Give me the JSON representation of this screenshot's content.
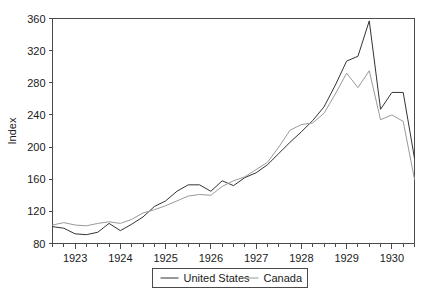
{
  "chart_data": {
    "type": "line",
    "title": "",
    "xlabel": "",
    "ylabel": "Index",
    "ylim": [
      80,
      360
    ],
    "xlim": [
      1922.5,
      1930.5
    ],
    "grid": false,
    "legend_position": "bottom-center",
    "y_ticks": [
      80,
      120,
      160,
      200,
      240,
      280,
      320,
      360
    ],
    "y_tick_labels": [
      "80",
      "120",
      "160",
      "200",
      "240",
      "280",
      "320",
      "360"
    ],
    "x_tick_labels": [
      "1923",
      "1924",
      "1925",
      "1926",
      "1927",
      "1928",
      "1929",
      "1930"
    ],
    "x_minor_ticks_per_year": 4,
    "x": [
      1922.5,
      1922.75,
      1923.0,
      1923.25,
      1923.5,
      1923.75,
      1924.0,
      1924.25,
      1924.5,
      1924.75,
      1925.0,
      1925.25,
      1925.5,
      1925.75,
      1926.0,
      1926.25,
      1926.5,
      1926.75,
      1927.0,
      1927.25,
      1927.5,
      1927.75,
      1928.0,
      1928.25,
      1928.5,
      1928.75,
      1929.0,
      1929.25,
      1929.5,
      1929.75,
      1930.0,
      1930.25,
      1930.5
    ],
    "series": [
      {
        "name": "United States",
        "color": "#333333",
        "values": [
          101,
          99,
          92,
          91,
          94,
          105,
          96,
          104,
          113,
          126,
          133,
          145,
          153,
          153,
          145,
          158,
          152,
          162,
          168,
          178,
          192,
          206,
          219,
          233,
          250,
          277,
          307,
          313,
          357,
          247,
          268,
          268,
          186
        ]
      },
      {
        "name": "Canada",
        "color": "#9a9a9a",
        "values": [
          103,
          106,
          103,
          102,
          105,
          107,
          105,
          110,
          118,
          122,
          127,
          133,
          139,
          141,
          140,
          151,
          158,
          163,
          172,
          181,
          200,
          221,
          228,
          230,
          242,
          266,
          292,
          274,
          295,
          234,
          240,
          232,
          160
        ]
      }
    ]
  },
  "legend": {
    "items": [
      {
        "label": "United States",
        "color": "#333333"
      },
      {
        "label": "Canada",
        "color": "#9a9a9a"
      }
    ]
  },
  "axes": {
    "y_title": "Index"
  }
}
